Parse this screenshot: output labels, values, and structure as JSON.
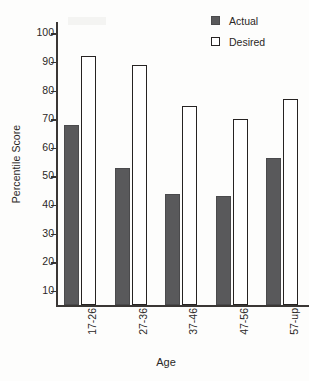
{
  "chart_data": {
    "type": "bar",
    "title": "",
    "xlabel": "Age",
    "ylabel": "Percentile Score",
    "categories": [
      "17-26",
      "27-36",
      "37-46",
      "47-56",
      "57-up"
    ],
    "series": [
      {
        "name": "Actual",
        "color": "#59595b",
        "values": [
          68,
          53,
          44,
          43,
          56.5
        ]
      },
      {
        "name": "Desired",
        "color": "#ffffff",
        "values": [
          92,
          89,
          74.5,
          70,
          77
        ]
      }
    ],
    "ylim": [
      5,
      104
    ],
    "yticks": [
      10,
      20,
      30,
      40,
      50,
      60,
      70,
      80,
      90,
      100
    ],
    "ytick_labels": [
      "10",
      "20",
      "30",
      "40",
      "50",
      "60",
      "70",
      "80",
      "90",
      "100"
    ],
    "grid": false,
    "legend_position": "top-right"
  },
  "legend": {
    "items": [
      {
        "label": "Actual",
        "swatch": "filled-square-dark"
      },
      {
        "label": "Desired",
        "swatch": "open-square-white"
      }
    ]
  }
}
